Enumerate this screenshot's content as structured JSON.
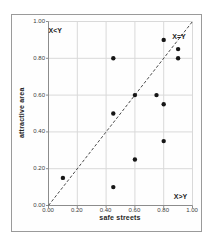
{
  "figure": {
    "xlabel": "safe streets",
    "ylabel": "attractive area"
  },
  "chart_data": {
    "type": "scatter",
    "title": "",
    "xlabel": "safe streets",
    "ylabel": "attractive area",
    "xlim": [
      0,
      1
    ],
    "ylim": [
      0,
      1
    ],
    "xticks": [
      "0.00",
      "0.20",
      "0.40",
      "0.60",
      "0.80",
      "1.00"
    ],
    "yticks": [
      "0.00",
      "0.20",
      "0.40",
      "0.60",
      "0.80",
      "1.00"
    ],
    "grid": true,
    "legend": "none",
    "points": [
      [
        0.1,
        0.15
      ],
      [
        0.45,
        0.1
      ],
      [
        0.45,
        0.5
      ],
      [
        0.45,
        0.8
      ],
      [
        0.6,
        0.25
      ],
      [
        0.6,
        0.6
      ],
      [
        0.75,
        0.6
      ],
      [
        0.8,
        0.35
      ],
      [
        0.8,
        0.55
      ],
      [
        0.8,
        0.9
      ],
      [
        0.9,
        0.8
      ],
      [
        0.9,
        0.85
      ]
    ],
    "reference_line": {
      "type": "identity",
      "from": [
        0,
        0
      ],
      "to": [
        1,
        1
      ],
      "style": "dashed",
      "label": "X=Y"
    },
    "annotations": [
      {
        "text": "X<Y",
        "x": 0.05,
        "y": 0.95
      },
      {
        "text": "X=Y",
        "x": 0.91,
        "y": 0.92
      },
      {
        "text": "X>Y",
        "x": 0.92,
        "y": 0.05
      }
    ],
    "marker": {
      "shape": "circle",
      "radius": 2.2,
      "color": "#161616"
    }
  },
  "colors": {
    "grid": "#d9d9d9",
    "axis": "#8c8c8c",
    "dashed_line": "#4a4a4a",
    "marker": "#161616",
    "border": "#9a9a9a"
  }
}
